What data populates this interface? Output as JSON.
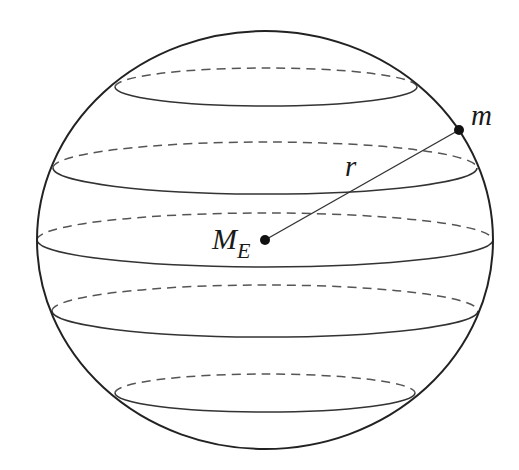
{
  "diagram": {
    "colors": {
      "background": "#ffffff",
      "outline": "#222222",
      "latitude_solid": "#333333",
      "latitude_dashed": "#555555",
      "points": "#111111"
    },
    "sphere": {
      "cx": 265,
      "cy": 240,
      "rx": 228,
      "ry": 209
    },
    "latitudes": [
      {
        "name": "latitude-1",
        "cx": 266,
        "cy": 87,
        "rx": 151,
        "ry": 19
      },
      {
        "name": "latitude-2",
        "cx": 265,
        "cy": 168,
        "rx": 212,
        "ry": 26
      },
      {
        "name": "latitude-3-equator",
        "cx": 265,
        "cy": 240,
        "rx": 228,
        "ry": 27
      },
      {
        "name": "latitude-4",
        "cx": 265,
        "cy": 311,
        "rx": 213,
        "ry": 26
      },
      {
        "name": "latitude-5",
        "cx": 265,
        "cy": 393,
        "rx": 150,
        "ry": 19
      }
    ],
    "points": {
      "center": {
        "x": 265,
        "y": 240,
        "label": "M",
        "subscript": "E"
      },
      "surface_mass": {
        "x": 459,
        "y": 130,
        "label": "m"
      }
    },
    "radius_label": "r"
  }
}
